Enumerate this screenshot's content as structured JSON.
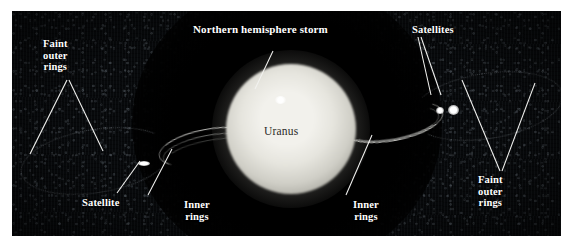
{
  "figure": {
    "kind": "annotated-astronomical-photograph",
    "subject": "Uranus",
    "background_color": "#07090b",
    "label_color": "#ffffff",
    "planet_label_color": "#2a2a28",
    "leader_line_color": "#f2f2f0"
  },
  "labels": {
    "storm": "Northern hemisphere storm",
    "planet": "Uranus",
    "satellites_right": "Satellites",
    "satellite_left": "Satellite",
    "inner_rings_left": "Inner\nrings",
    "inner_rings_right": "Inner\nrings",
    "faint_outer_rings_left": "Faint\nouter\nrings",
    "faint_outer_rings_right": "Faint\nouter\nrings"
  },
  "features": {
    "planet_disk": "bright pale disk of Uranus",
    "storm_spot": "bright white storm spot in northern hemisphere",
    "inner_ring_arc_left": "inner rings arc, left of planet",
    "inner_ring_arc_right": "inner rings arc, right of planet",
    "outer_ring_arc_left": "faint outer ring arc, far left",
    "outer_ring_arc_right": "faint outer ring arc, far right",
    "satellite_left": "single bright satellite, lower left",
    "satellite_right_a": "bright satellite, upper right",
    "satellite_right_b": "bright satellite, upper right"
  }
}
